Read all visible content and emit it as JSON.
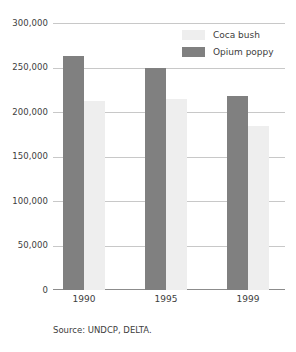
{
  "chart_data": {
    "type": "bar",
    "title": "",
    "xlabel": "",
    "ylabel": "",
    "categories": [
      "1990",
      "1995",
      "1999"
    ],
    "series": [
      {
        "name": "Coca bush",
        "color": "#eeeeee",
        "values": [
          212000,
          215000,
          184000
        ]
      },
      {
        "name": "Opium poppy",
        "color": "#808080",
        "values": [
          263000,
          250000,
          218000
        ]
      }
    ],
    "ylim": [
      0,
      300000
    ],
    "ytick_values": [
      0,
      50000,
      100000,
      150000,
      200000,
      250000,
      300000
    ],
    "ytick_labels": [
      "0",
      "50,000",
      "100,000",
      "150,000",
      "200,000",
      "250,000",
      "300,000"
    ],
    "grid": true,
    "legend_position": "top-right",
    "source": "Source: UNDCP, DELTA."
  },
  "legend": {
    "items": [
      {
        "label": "Coca bush"
      },
      {
        "label": "Opium poppy"
      }
    ]
  },
  "footer": {
    "source": "Source: UNDCP, DELTA."
  }
}
